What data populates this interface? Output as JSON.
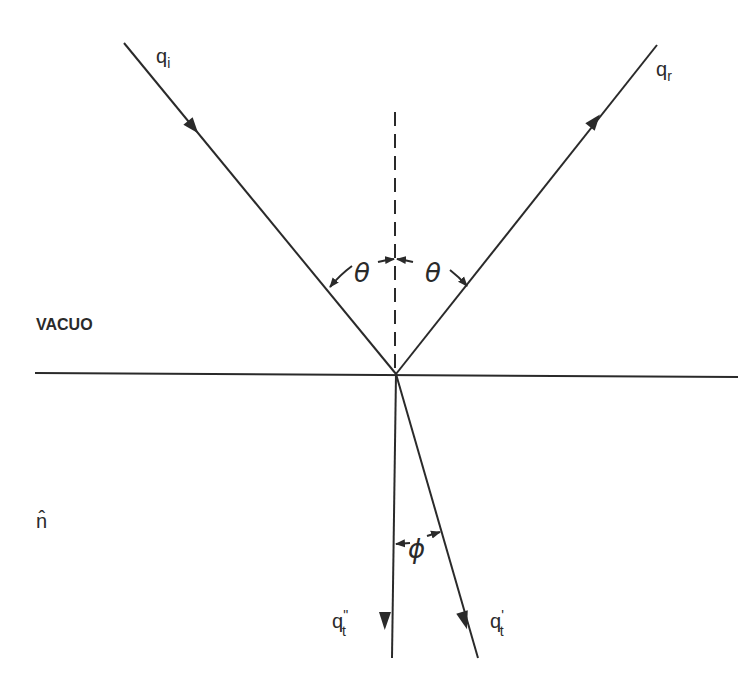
{
  "diagram": {
    "title": "",
    "region_labels": {
      "top": "VACUO",
      "bottom": "n̂"
    },
    "rays": {
      "incident": {
        "label_main": "q",
        "label_sub": "i"
      },
      "reflected": {
        "label_main": "q",
        "label_sub": "r"
      },
      "transmitted_prime": {
        "label_main": "q",
        "label_sup": "'",
        "label_sub": "t"
      },
      "transmitted_double_prime": {
        "label_main": "q",
        "label_sup": "\"",
        "label_sub": "t"
      }
    },
    "angles": {
      "incidence": "θ",
      "reflection": "θ",
      "between_transmitted": "ϕ"
    },
    "colors": {
      "line": "#2a2a2a",
      "background": "#ffffff"
    }
  }
}
